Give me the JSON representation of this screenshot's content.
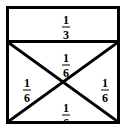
{
  "figure": {
    "name": "fraction-area-model",
    "colors": {
      "line": "#000000",
      "background": "#ffffff"
    },
    "regions": [
      {
        "id": "top-band",
        "label": "1/3",
        "numerator": "1",
        "denominator": "3",
        "shape": "rectangle"
      },
      {
        "id": "upper-triangle",
        "label": "1/6",
        "numerator": "1",
        "denominator": "6",
        "shape": "triangle"
      },
      {
        "id": "left-triangle",
        "label": "1/6",
        "numerator": "1",
        "denominator": "6",
        "shape": "triangle"
      },
      {
        "id": "right-triangle",
        "label": "1/6",
        "numerator": "1",
        "denominator": "6",
        "shape": "triangle"
      },
      {
        "id": "lower-triangle",
        "label": "1/6",
        "numerator": "1",
        "denominator": "6",
        "shape": "triangle"
      }
    ]
  }
}
